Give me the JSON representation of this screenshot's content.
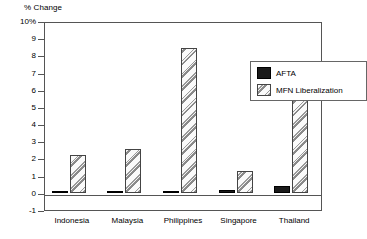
{
  "chart_data": {
    "type": "bar",
    "title": "",
    "subtitle": "",
    "xlabel": "",
    "ylabel": "% Change",
    "ylim": [
      -1,
      10
    ],
    "ytick_labels": [
      "10%",
      "9",
      "8",
      "7",
      "6",
      "5",
      "4",
      "3",
      "2",
      "1",
      "0",
      "-1"
    ],
    "ytick_values": [
      10,
      9,
      8,
      7,
      6,
      5,
      4,
      3,
      2,
      1,
      0,
      -1
    ],
    "grid": false,
    "legend_position": "top-right-inside",
    "categories": [
      "Indonesia",
      "Malaysia",
      "Philippines",
      "Singapore",
      "Thailand"
    ],
    "series": [
      {
        "name": "AFTA",
        "color": "#1a1a1a",
        "pattern": "solid",
        "values": [
          0.1,
          0.1,
          0.1,
          0.15,
          0.4
        ]
      },
      {
        "name": "MFN Liberalization",
        "color": "#e8e8e8",
        "pattern": "diagonal-hatch",
        "values": [
          2.2,
          2.55,
          8.45,
          1.3,
          5.6
        ]
      }
    ]
  },
  "legend": {
    "items": [
      {
        "label": "AFTA"
      },
      {
        "label": "MFN Liberalization"
      }
    ]
  }
}
